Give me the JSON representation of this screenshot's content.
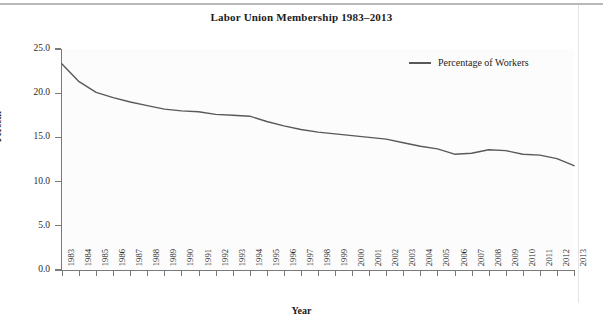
{
  "chart_data": {
    "type": "line",
    "title": "Labor Union Membership 1983–2013",
    "xlabel": "Year",
    "ylabel": "Percent",
    "ylim": [
      0.0,
      25.0
    ],
    "yticks": [
      "0.0",
      "5.0",
      "10.0",
      "15.0",
      "20.0",
      "25.0"
    ],
    "ytick_values": [
      0.0,
      5.0,
      10.0,
      15.0,
      20.0,
      25.0
    ],
    "grid": false,
    "legend_position": "top-right",
    "line_color": "#595959",
    "categories": [
      "1983",
      "1984",
      "1985",
      "1986",
      "1987",
      "1988",
      "1989",
      "1990",
      "1991",
      "1992",
      "1993",
      "1994",
      "1995",
      "1996",
      "1997",
      "1998",
      "1999",
      "2000",
      "2001",
      "2002",
      "2003",
      "2004",
      "2005",
      "2006",
      "2007",
      "2008",
      "2009",
      "2010",
      "2011",
      "2012",
      "2013"
    ],
    "series": [
      {
        "name": "Percentage of Workers",
        "values": [
          23.3,
          21.3,
          20.1,
          19.5,
          19.0,
          18.6,
          18.2,
          18.0,
          17.9,
          17.6,
          17.5,
          17.4,
          16.8,
          16.3,
          15.9,
          15.6,
          15.4,
          15.2,
          15.0,
          14.8,
          14.4,
          14.0,
          13.7,
          13.1,
          13.2,
          13.6,
          13.5,
          13.1,
          13.0,
          12.6,
          11.8
        ]
      }
    ],
    "legend": [
      "Percentage of Workers"
    ]
  }
}
